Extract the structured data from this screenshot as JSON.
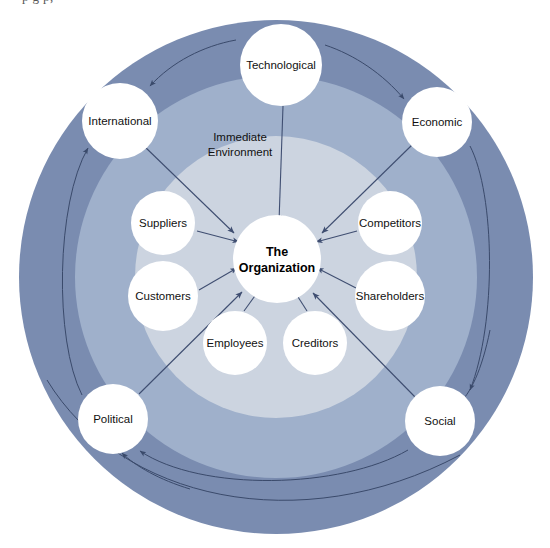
{
  "figure": {
    "title_partial_above": "p  g  p,",
    "center_node": {
      "line1": "The",
      "line2": "Organization"
    },
    "zone_label": {
      "line1": "Immediate",
      "line2": "Environment"
    },
    "inner_nodes": [
      {
        "id": "suppliers",
        "label": "Suppliers",
        "cx": 163,
        "cy": 223,
        "r": 32
      },
      {
        "id": "customers",
        "label": "Customers",
        "cx": 163,
        "cy": 296,
        "r": 35
      },
      {
        "id": "employees",
        "label": "Employees",
        "cx": 235,
        "cy": 343,
        "r": 32
      },
      {
        "id": "creditors",
        "label": "Creditors",
        "cx": 315,
        "cy": 343,
        "r": 32
      },
      {
        "id": "shareholders",
        "label": "Shareholders",
        "cx": 390,
        "cy": 296,
        "r": 35
      },
      {
        "id": "competitors",
        "label": "Competitors",
        "cx": 390,
        "cy": 223,
        "r": 32
      }
    ],
    "outer_nodes": [
      {
        "id": "technological",
        "label": "Technological",
        "cx": 281,
        "cy": 65,
        "r": 41
      },
      {
        "id": "economic",
        "label": "Economic",
        "cx": 437,
        "cy": 122,
        "r": 35
      },
      {
        "id": "social",
        "label": "Social",
        "cx": 440,
        "cy": 421,
        "r": 35
      },
      {
        "id": "political",
        "label": "Political",
        "cx": 113,
        "cy": 419,
        "r": 35
      },
      {
        "id": "international",
        "label": "International",
        "cx": 120,
        "cy": 121,
        "r": 38
      }
    ],
    "rings": {
      "center_x": 276,
      "center_y": 277,
      "outer_radius": 257,
      "middle_radius": 201,
      "inner_radius": 141
    },
    "colors": {
      "ring_outer": "#7a8cb0",
      "ring_middle": "#9fb0cb",
      "ring_inner": "#ccd4e0",
      "node_fill": "#ffffff",
      "arrow": "#3f4e71",
      "text": "#111111",
      "background": "#ffffff"
    }
  }
}
